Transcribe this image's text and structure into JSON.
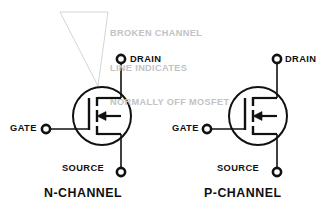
{
  "figure": {
    "background_color": "#ffffff",
    "line_color": "#111111",
    "annotation_color": "#c3c3c3"
  },
  "annotation": {
    "name": "broken-channel-note",
    "lines": [
      "BROKEN CHANNEL",
      "LINE INDICATES",
      "NORMALLY OFF MOSFET"
    ]
  },
  "symbols": [
    {
      "id": "n-channel",
      "caption": "N-CHANNEL",
      "terminals": {
        "drain": "DRAIN",
        "gate": "GATE",
        "source": "SOURCE"
      }
    },
    {
      "id": "p-channel",
      "caption": "P-CHANNEL",
      "terminals": {
        "drain": "DRAIN",
        "gate": "GATE",
        "source": "SOURCE"
      }
    }
  ]
}
